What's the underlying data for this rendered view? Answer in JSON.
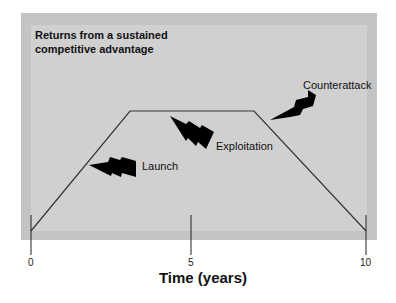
{
  "diagram": {
    "title": "Returns from a sustained competitive advantage",
    "phases": [
      {
        "label": "Launch"
      },
      {
        "label": "Exploitation"
      },
      {
        "label": "Counterattack"
      }
    ],
    "x_axis": {
      "title": "Time (years)",
      "ticks": [
        "0",
        "5",
        "10"
      ]
    },
    "colors": {
      "frame_outer": "#c4c4c4",
      "frame_inner": "#d0d0d0",
      "line": "#333333",
      "bolt": "#000000"
    }
  }
}
